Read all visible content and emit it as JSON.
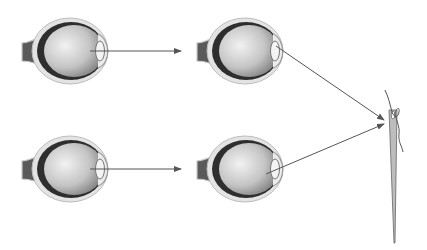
{
  "diagram": {
    "type": "eye-focusing-comparison",
    "text_labels": [],
    "colors": {
      "background": "#ffffff",
      "outer_layer": "#d8d8d8",
      "choroid": "#3a3a3a",
      "vitreous_light": "#f0f0f0",
      "vitreous_dark": "#8a8a8a",
      "arrow": "#555555",
      "needle": "#666666"
    },
    "rows": [
      {
        "name": "top",
        "left_eye": {
          "cx": 70,
          "cy": 51
        },
        "right_eye": {
          "cx": 245,
          "cy": 51
        },
        "left_arrow": {
          "x1": 92,
          "y1": 51,
          "x2": 180,
          "y2": 51
        },
        "right_arrow": {
          "x1": 278,
          "y1": 47,
          "x2": 385,
          "y2": 120
        }
      },
      {
        "name": "bottom",
        "left_eye": {
          "cx": 70,
          "cy": 169
        },
        "right_eye": {
          "cx": 245,
          "cy": 169
        },
        "left_arrow": {
          "x1": 92,
          "y1": 169,
          "x2": 180,
          "y2": 169
        },
        "right_arrow": {
          "x1": 268,
          "y1": 173,
          "x2": 385,
          "y2": 124
        }
      }
    ],
    "needle": {
      "x": 393,
      "top": 112,
      "bottom": 243,
      "thread_start_y": 90
    }
  }
}
